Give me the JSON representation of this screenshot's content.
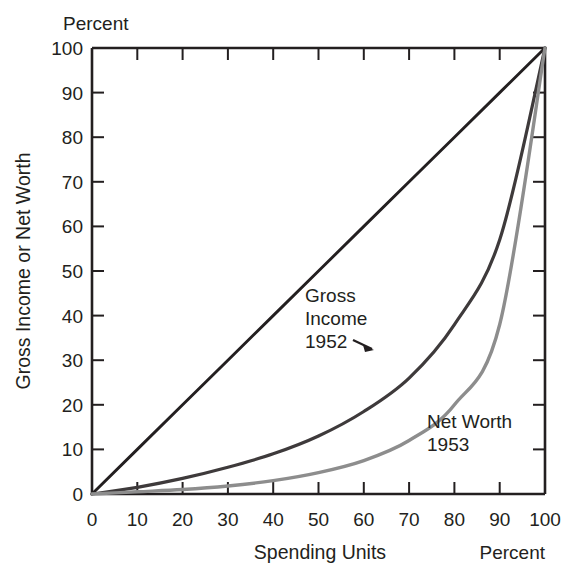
{
  "chart_data": {
    "type": "line",
    "title": "",
    "subtitle": "",
    "xlabel": "Spending Units",
    "ylabel": "Gross Income or Net Worth",
    "x_unit_label": "Percent",
    "y_unit_label": "Percent",
    "xlim": [
      0,
      100
    ],
    "ylim": [
      0,
      100
    ],
    "grid": false,
    "legend_position": "inline-annotations",
    "x_ticks": [
      0,
      10,
      20,
      30,
      40,
      50,
      60,
      70,
      80,
      90,
      100
    ],
    "y_ticks": [
      0,
      10,
      20,
      30,
      40,
      50,
      60,
      70,
      80,
      90,
      100
    ],
    "x_tick_labels": [
      "0",
      "10",
      "20",
      "30",
      "40",
      "50",
      "60",
      "70",
      "80",
      "90",
      "100"
    ],
    "y_tick_labels": [
      "0",
      "10",
      "20",
      "30",
      "40",
      "50",
      "60",
      "70",
      "80",
      "90",
      "100"
    ],
    "x": [
      0,
      10,
      20,
      30,
      40,
      50,
      60,
      70,
      80,
      90,
      100
    ],
    "series": [
      {
        "name": "Line of equality",
        "annotation": "",
        "color": "#231f20",
        "width": 2.9,
        "values": [
          0,
          10,
          20,
          30,
          40,
          50,
          60,
          70,
          80,
          90,
          100
        ]
      },
      {
        "name": "Gross Income 1952",
        "annotation": "Gross Income 1952",
        "annotation_line1": "Gross",
        "annotation_line2": "Income",
        "annotation_line3": "1952",
        "color": "#3e3a3b",
        "width": 3.2,
        "values": [
          0,
          1.5,
          3.5,
          6.0,
          9.0,
          13.0,
          18.5,
          26.0,
          38.0,
          57.0,
          100
        ]
      },
      {
        "name": "Net Worth 1953",
        "annotation": "Net Worth 1953",
        "annotation_line1": "Net Worth",
        "annotation_line2": "1953",
        "color": "#8d8d8d",
        "width": 3.4,
        "values": [
          0,
          0.5,
          1.0,
          1.8,
          3.0,
          4.8,
          7.5,
          12.0,
          20.0,
          38.0,
          100
        ]
      }
    ],
    "annotations": [
      {
        "text": "Gross Income 1952",
        "has_arrow": true
      },
      {
        "text": "Net Worth 1953",
        "has_arrow": false
      }
    ]
  },
  "axes": {
    "y_top_unit": "Percent",
    "y_axis_title": "Gross Income or Net Worth",
    "x_axis_title": "Spending Units",
    "x_right_unit": "Percent"
  },
  "ticks": {
    "y": [
      "100",
      "90",
      "80",
      "70",
      "60",
      "50",
      "40",
      "30",
      "20",
      "10",
      "0"
    ],
    "x": [
      "0",
      "10",
      "20",
      "30",
      "40",
      "50",
      "60",
      "70",
      "80",
      "90",
      "100"
    ]
  },
  "labels": {
    "gross_1": "Gross",
    "gross_2": "Income",
    "gross_3": "1952",
    "net_1": "Net Worth",
    "net_2": "1953"
  },
  "colors": {
    "ink": "#231f20",
    "equality": "#231f20",
    "gross_income": "#3e3a3b",
    "net_worth": "#8d8d8d",
    "background": "#ffffff"
  }
}
